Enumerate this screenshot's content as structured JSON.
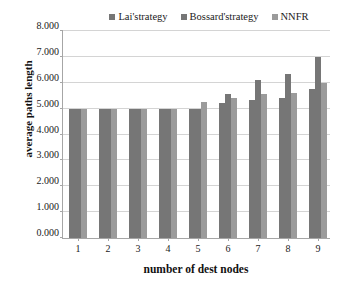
{
  "chart_data": {
    "type": "bar",
    "title": "",
    "xlabel": "number of dest nodes",
    "ylabel": "average paths length",
    "categories": [
      "1",
      "2",
      "3",
      "4",
      "5",
      "6",
      "7",
      "8",
      "9"
    ],
    "ylim": [
      0,
      8
    ],
    "ytick_labels": [
      "0.000",
      "1.000",
      "2.000",
      "3.000",
      "4.000",
      "5.000",
      "6.000",
      "7.000",
      "8.000"
    ],
    "ytick_values": [
      0,
      1,
      2,
      3,
      4,
      5,
      6,
      7,
      8
    ],
    "grid": true,
    "legend_position": "top",
    "series": [
      {
        "name": "Lai'strategy",
        "color": "#767676",
        "values": [
          5.0,
          5.0,
          5.0,
          5.0,
          5.0,
          5.2,
          5.35,
          5.4,
          5.75
        ]
      },
      {
        "name": "Bossard'strategy",
        "color": "#767676",
        "values": [
          5.0,
          5.0,
          5.0,
          5.0,
          5.0,
          5.55,
          6.1,
          6.35,
          7.0
        ]
      },
      {
        "name": "NNFR",
        "color": "#9b9b9b",
        "values": [
          5.0,
          5.0,
          5.0,
          5.0,
          5.25,
          5.4,
          5.55,
          5.6,
          6.0
        ]
      }
    ]
  }
}
